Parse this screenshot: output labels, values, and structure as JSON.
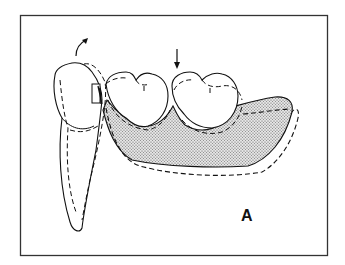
{
  "figure": {
    "panel_label": "A",
    "arrows": [
      {
        "name": "rotation-arrow",
        "meaning": "curved arrow indicating tipping/rotation of abutment tooth"
      },
      {
        "name": "force-arrow",
        "meaning": "vertical arrow indicating occlusal force on molar"
      }
    ],
    "colors": {
      "line": "#111111",
      "base_fill": "#cfcfcf",
      "background": "#ffffff"
    }
  }
}
